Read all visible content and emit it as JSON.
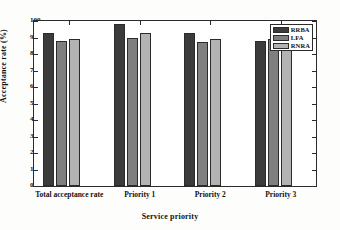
{
  "chart_data": {
    "type": "bar",
    "title": "",
    "subtitle": "",
    "xlabel": "Service priority",
    "ylabel": "Acceptance rate (%)",
    "ylim": [
      0,
      100
    ],
    "ytick_step": 10,
    "yticks": [
      0,
      10,
      20,
      30,
      40,
      50,
      60,
      70,
      80,
      90,
      100
    ],
    "ytick_labels": [
      "0",
      "10",
      "20",
      "30",
      "40",
      "50",
      "60",
      "70",
      "80",
      "90",
      "100"
    ],
    "grid": false,
    "legend_position": "top-right-inside",
    "categories": [
      "Total acceptance rate",
      "Priority 1",
      "Priority 2",
      "Priority 3"
    ],
    "series": [
      {
        "name": "RRBA",
        "color": "#3b3b3b",
        "values": [
          93.0,
          98.0,
          92.5,
          88.0
        ]
      },
      {
        "name": "LFA",
        "color": "#7f7f7f",
        "values": [
          88.0,
          90.0,
          87.0,
          89.0
        ]
      },
      {
        "name": "RNRA",
        "color": "#b3b3b3",
        "values": [
          89.0,
          92.5,
          89.0,
          88.0
        ]
      }
    ]
  },
  "colors": {
    "axis": "#2b2b2b",
    "background": "#ffffff",
    "text": "#111111",
    "series_rrba": "#3b3b3b",
    "series_lfa": "#7f7f7f",
    "series_rnra": "#b3b3b3"
  }
}
